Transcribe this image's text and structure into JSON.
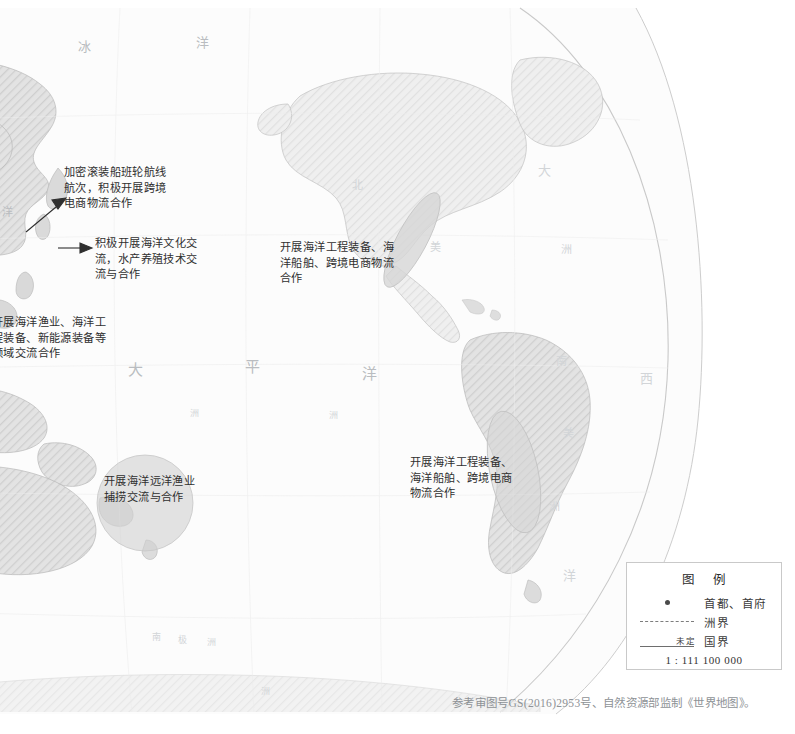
{
  "map": {
    "title_note": "参考审图号GS(2016)2953号、自然资源部监制《世界地图》。",
    "geo_labels": [
      {
        "id": "arctic-1",
        "text": "冰",
        "x": 78,
        "y": 36,
        "size": "geo-lg"
      },
      {
        "id": "arctic-2",
        "text": "洋",
        "x": 196,
        "y": 32,
        "size": "geo-lg"
      },
      {
        "id": "pacific-1",
        "text": "大",
        "x": 128,
        "y": 358,
        "size": "geo-xl"
      },
      {
        "id": "pacific-2",
        "text": "平",
        "x": 245,
        "y": 355,
        "size": "geo-xl"
      },
      {
        "id": "pacific-3",
        "text": "洋",
        "x": 362,
        "y": 362,
        "size": "geo-xl"
      },
      {
        "id": "asia-east",
        "text": "洋",
        "x": 2,
        "y": 203,
        "size": "geo-md"
      },
      {
        "id": "namerica-1",
        "text": "北",
        "x": 352,
        "y": 176,
        "size": "geo-md"
      },
      {
        "id": "namerica-2",
        "text": "大",
        "x": 538,
        "y": 160,
        "size": "geo-lg"
      },
      {
        "id": "namerica-3",
        "text": "美",
        "x": 430,
        "y": 238,
        "size": "geo-md"
      },
      {
        "id": "namerica-4",
        "text": "洲",
        "x": 561,
        "y": 240,
        "size": "geo-md"
      },
      {
        "id": "satlantic-1",
        "text": "西",
        "x": 640,
        "y": 368,
        "size": "geo-lg"
      },
      {
        "id": "samerica-1",
        "text": "南",
        "x": 556,
        "y": 352,
        "size": "geo-md"
      },
      {
        "id": "samerica-2",
        "text": "美",
        "x": 563,
        "y": 424,
        "size": "geo-md"
      },
      {
        "id": "samerica-3",
        "text": "洲",
        "x": 549,
        "y": 497,
        "size": "geo-md"
      },
      {
        "id": "satlantic-2",
        "text": "洋",
        "x": 563,
        "y": 565,
        "size": "geo-lg"
      },
      {
        "id": "oceania-1",
        "text": "洲",
        "x": 190,
        "y": 406,
        "size": "geo-sm"
      },
      {
        "id": "oceania-2",
        "text": "洲",
        "x": 329,
        "y": 408,
        "size": "geo-sm"
      },
      {
        "id": "ant-1",
        "text": "南",
        "x": 152,
        "y": 630,
        "size": "geo-sm"
      },
      {
        "id": "ant-2",
        "text": "极",
        "x": 178,
        "y": 633,
        "size": "geo-sm"
      },
      {
        "id": "ant-3",
        "text": "洲",
        "x": 207,
        "y": 635,
        "size": "geo-sm"
      },
      {
        "id": "ant-4",
        "text": "洲",
        "x": 261,
        "y": 684,
        "size": "geo-sm"
      }
    ],
    "callouts": [
      {
        "id": "callout-roro",
        "text": "加密滚装船班轮航线\n航次，积极开展跨境\n电商物流合作",
        "x": 64,
        "y": 165,
        "width": 150
      },
      {
        "id": "callout-culture",
        "text": "积极开展海洋文化交\n流，水产养殖技术交\n流与合作",
        "x": 95,
        "y": 236,
        "width": 150
      },
      {
        "id": "callout-fishery-equip",
        "text": "开展海洋渔业、海洋工\n程装备、新能源装备等\n领域交流合作",
        "x": -8,
        "y": 315,
        "width": 165
      },
      {
        "id": "callout-mexico",
        "text": "开展海洋工程装备、海\n洋船舶、跨境电商物流\n合作",
        "x": 280,
        "y": 240,
        "width": 160
      },
      {
        "id": "callout-samerica",
        "text": "开展海洋工程装备、\n海洋船舶、跨境电商\n物流合作",
        "x": 410,
        "y": 455,
        "width": 155
      },
      {
        "id": "callout-deepsea",
        "text": "开展海洋远洋渔业\n捕捞交流与合作",
        "x": 104,
        "y": 474,
        "width": 140
      }
    ]
  },
  "legend": {
    "title": "图  例",
    "rows": [
      {
        "id": "capital",
        "symbol": "capital-dot",
        "label": "首都、首府"
      },
      {
        "id": "continental",
        "symbol": "dashed-line",
        "label": "洲界"
      },
      {
        "id": "national",
        "symbol": "solid-line-undetermined",
        "label": "国界",
        "symbol_note": "未定"
      }
    ],
    "scale": "1 : 111 100 000"
  },
  "colors": {
    "land": "#dcdcdc",
    "land_stroke": "#b4b4b4",
    "ocean": "#fbfbfb",
    "globe_outline": "#c4c4c4",
    "highlight_fill": "#d4d4d4",
    "annotation_text": "#2f2f2f",
    "label_text": "#b9bcc0",
    "footer_text": "#8e9296"
  }
}
